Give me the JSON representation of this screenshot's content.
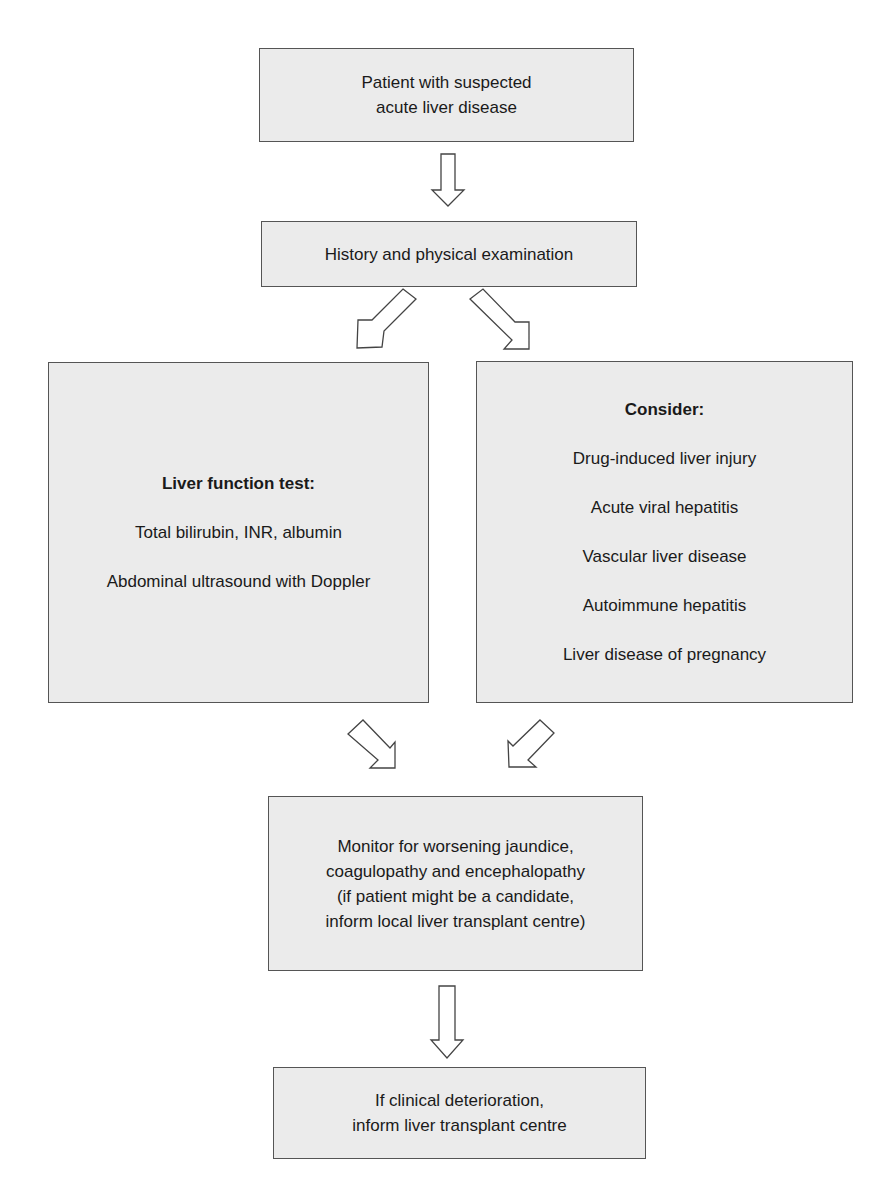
{
  "flowchart": {
    "nodes": {
      "start": {
        "lines": [
          "Patient with suspected",
          "acute liver disease"
        ]
      },
      "history": {
        "lines": [
          "History and physical examination"
        ]
      },
      "lft": {
        "heading": "Liver function test:",
        "items": [
          "Total bilirubin, INR, albumin",
          "Abdominal ultrasound with Doppler"
        ]
      },
      "consider": {
        "heading": "Consider:",
        "items": [
          "Drug-induced liver injury",
          "Acute viral hepatitis",
          "Vascular liver disease",
          "Autoimmune hepatitis",
          "Liver disease of pregnancy"
        ]
      },
      "monitor": {
        "lines": [
          "Monitor for worsening jaundice,",
          "coagulopathy and encephalopathy",
          "(if patient might be a candidate,",
          "inform local liver transplant centre)"
        ]
      },
      "final": {
        "lines": [
          "If clinical deterioration,",
          "inform liver transplant centre"
        ]
      }
    },
    "colors": {
      "box_fill": "#ebebeb",
      "box_border": "#555555",
      "arrow_fill": "#ffffff",
      "arrow_stroke": "#444444"
    }
  }
}
